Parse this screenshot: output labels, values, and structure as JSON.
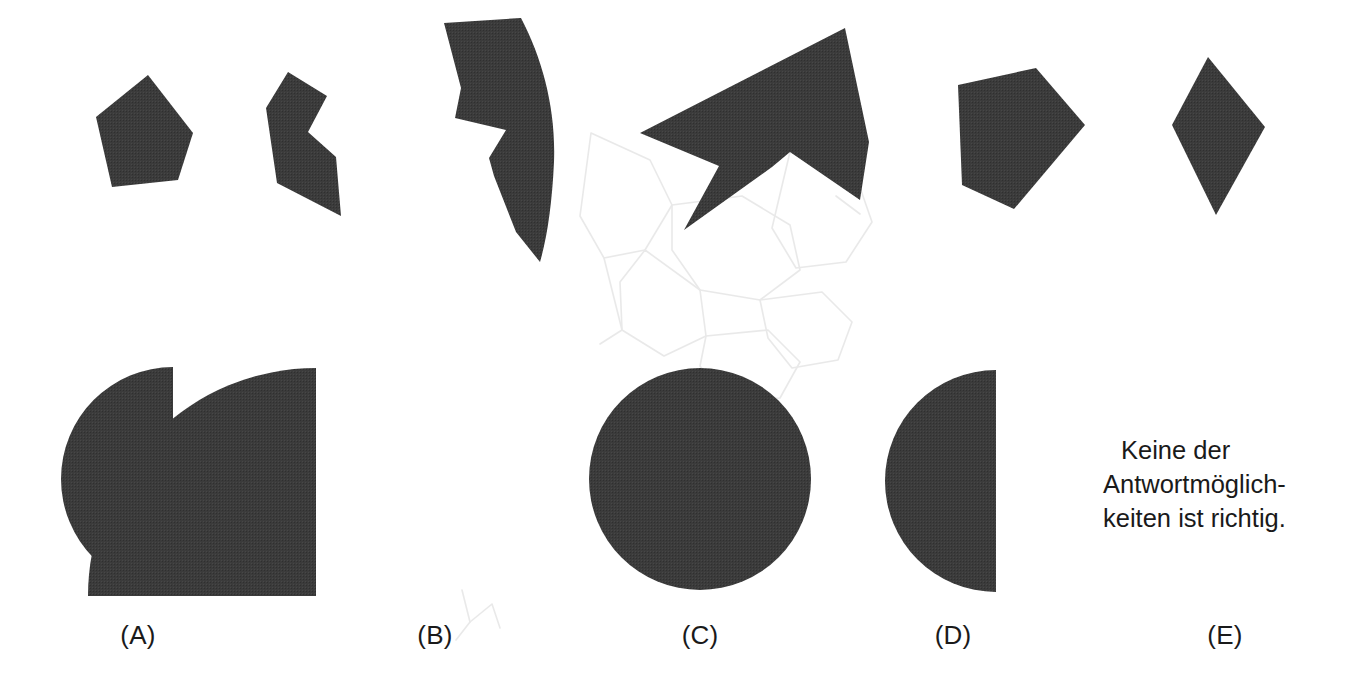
{
  "page": {
    "kind": "spatial-reasoning-test-item",
    "language": "de",
    "width": 1357,
    "height": 683,
    "background_color": "#ffffff",
    "shape_fill_color": "#3b3b3b",
    "text_color": "#1a1a1a"
  },
  "prompt_row": {
    "description": "Row of six dark puzzle-piece fragments along the top of the sheet",
    "piece_count": 6,
    "pieces": [
      {
        "id": "piece-1",
        "name": "pentagon-fragment",
        "shape": "convex pentagon, tall, apex upper-right",
        "points": "148,75 193,133 178,180 112,187 96,117"
      },
      {
        "id": "piece-2",
        "name": "notched-fragment",
        "shape": "concave hexagon with a V notch cut into the right side",
        "points": "288,72 327,96 308,132 336,157 341,216 277,183 266,108"
      },
      {
        "id": "piece-3",
        "name": "crescent-fragment",
        "shape": "curved sliver with a deep notch on the left and a convex arc on the right",
        "points": "444,23 521,18 548,75 556,140 551,200 540,262 506,214 489,159 505,130 455,118 461,88"
      },
      {
        "id": "piece-4",
        "name": "arrow-fragment",
        "shape": "large arrow/chevron wedge with a deep re-entrant notch at the bottom",
        "points": "845,28 869,140 860,199 790,152 772,167 684,230 717,167 640,133"
      },
      {
        "id": "piece-5",
        "name": "pentagon-right-fragment",
        "shape": "convex pentagon pointing to the right",
        "points": "1036,68 1085,125 1014,209 962,185 958,85"
      },
      {
        "id": "piece-6",
        "name": "kite-fragment",
        "shape": "kite / rhombus with long lower point",
        "points": "1208,57 1265,127 1216,215 1172,125"
      }
    ]
  },
  "answers": {
    "count": 5,
    "options": [
      {
        "key": "A",
        "label": "(A)",
        "name": "answer-option-a",
        "shape": "pac-man circle, quarter wedge removed from upper-right quadrant",
        "geometry": {
          "cx": 173,
          "cy": 479,
          "r": 112
        }
      },
      {
        "key": "B",
        "label": "(B)",
        "name": "answer-option-b",
        "shape": "quarter disc, square corner at bottom-right",
        "geometry": {
          "cx": 316,
          "cy": 596,
          "r": 228
        }
      },
      {
        "key": "C",
        "label": "(C)",
        "name": "answer-option-c",
        "shape": "full circle",
        "geometry": {
          "cx": 700,
          "cy": 479,
          "r": 111
        }
      },
      {
        "key": "D",
        "label": "(D)",
        "name": "answer-option-d",
        "shape": "left half disc, flat vertical edge on the right",
        "geometry": {
          "cx": 996,
          "cy": 481,
          "r": 111
        }
      },
      {
        "key": "E",
        "label": "(E)",
        "name": "answer-option-e",
        "shape": "text only, no figure",
        "geometry": null
      }
    ]
  },
  "none_of_the_above": {
    "name": "none-of-the-above-text",
    "full_text": "Keine der Antwortmöglichkeiten ist richtig.",
    "lines": [
      "Keine der",
      "Antwortmöglich-",
      "keiten ist richtig."
    ]
  },
  "annotations": {
    "description": "Faint hand-drawn pencil sketch lines in the middle of the sheet and a small pencil check mark beside option B",
    "pencil_sketch_color": "#cfcfcf",
    "check_mark_near": "B"
  }
}
